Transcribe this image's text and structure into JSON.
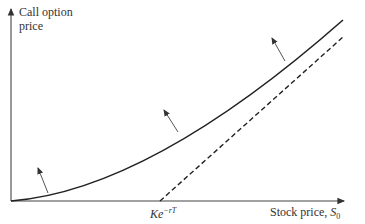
{
  "diagram": {
    "y_axis_label_line1": "Call option",
    "y_axis_label_line2": "price",
    "x_axis_label": "Stock price, ",
    "x_axis_label_sub": "0",
    "x_axis_label_var": "S",
    "strike_label": "Ke",
    "strike_label_sup": "−rT",
    "curves": [
      {
        "name": "call-price-curve",
        "style": "solid"
      },
      {
        "name": "lower-bound-line",
        "style": "dashed",
        "equation": "S0 − Ke^(−rT)"
      }
    ],
    "arrows": 3,
    "colors": {
      "line": "#222222",
      "arrow": "#555555",
      "background": "#ffffff"
    }
  }
}
